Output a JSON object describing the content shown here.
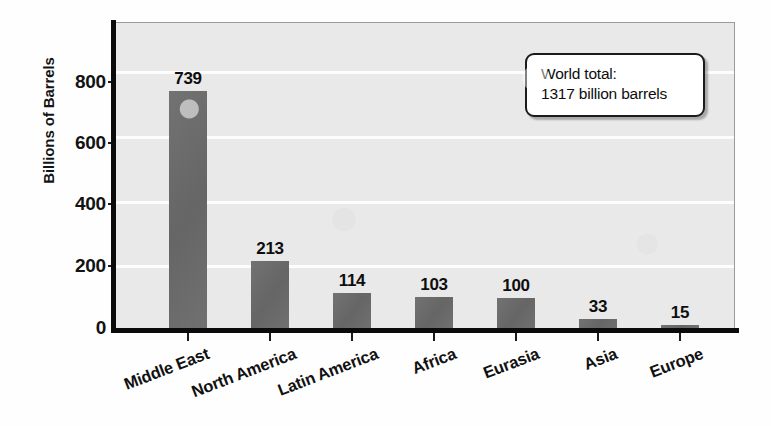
{
  "chart_data": {
    "type": "bar",
    "title": "",
    "xlabel": "",
    "ylabel": "Billions of Barrels",
    "ylim": [
      0,
      950
    ],
    "yticks": [
      0,
      200,
      400,
      600,
      800
    ],
    "ytick_labels": [
      "0",
      "200",
      "400",
      "600",
      "800"
    ],
    "grid": true,
    "gridlines_at": [
      200,
      400,
      600,
      800
    ],
    "legend": "none",
    "orientation": "vertical",
    "categories": [
      "Middle East",
      "North America",
      "Latin America",
      "Africa",
      "Eurasia",
      "Asia",
      "Europe"
    ],
    "values": [
      739,
      213,
      114,
      103,
      100,
      33,
      15
    ],
    "value_labels": [
      "739",
      "213",
      "114",
      "103",
      "100",
      "33",
      "15"
    ],
    "bar_color": "#6b6b6b",
    "plot_background": "#e9e9e9",
    "gridline_color": "#fdfdfd",
    "axis_color": "#0b0b0b",
    "annotations": [
      {
        "name": "world-total-callout",
        "line1": "World total:",
        "line2": "1317 billion barrels"
      }
    ]
  }
}
